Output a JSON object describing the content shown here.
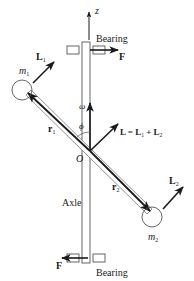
{
  "diagram": {
    "title": "",
    "labels": {
      "z_axis": "z",
      "bearing_top": "Bearing",
      "bearing_bottom": "Bearing",
      "force_top": "F",
      "force_bottom": "F",
      "mass1": "m",
      "mass1_sub": "1",
      "mass2": "m",
      "mass2_sub": "2",
      "L1": "L",
      "L1_sub": "1",
      "L2": "L",
      "L2_sub": "2",
      "L_total_main": "L = L",
      "L_total_sub1": "1",
      "L_total_plus": " + L",
      "L_total_sub2": "2",
      "r1": "r",
      "r1_sub": "1",
      "r2": "r",
      "r2_sub": "2",
      "omega": "ω",
      "phi": "ϕ",
      "origin": "O",
      "axle": "Axle"
    },
    "colors": {
      "ink": "#1a1a1a",
      "background": "#ffffff",
      "outline": "#555555"
    }
  }
}
